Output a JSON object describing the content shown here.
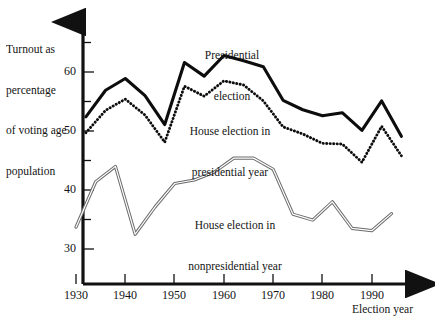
{
  "chart_data": {
    "type": "line",
    "title": "",
    "xlabel": "Election year",
    "ylabel": "Turnout as percentage of voting age population",
    "ylabel_lines": [
      "Turnout as",
      "percentage",
      "of voting age",
      "population"
    ],
    "xlim": [
      1930,
      1996
    ],
    "ylim": [
      28.5,
      65
    ],
    "grid": false,
    "legend_position": "inline-annotations",
    "yticks_major": [
      30,
      40,
      50,
      60
    ],
    "yticks_minor": [
      35,
      45,
      55,
      65
    ],
    "ytick_labels": [
      "30",
      "40",
      "50",
      "60"
    ],
    "xticks": [
      1930,
      1940,
      1950,
      1960,
      1970,
      1980,
      1990
    ],
    "xtick_labels": [
      "1930",
      "1940",
      "1950",
      "1960",
      "1970",
      "1980",
      "1990"
    ],
    "series": [
      {
        "name": "Presidential election",
        "style": "thick-solid",
        "color": "#0d0d0d",
        "label_lines": [
          "Presidential",
          "election"
        ],
        "x": [
          1932,
          1936,
          1940,
          1944,
          1948,
          1952,
          1956,
          1960,
          1964,
          1968,
          1972,
          1976,
          1980,
          1984,
          1988,
          1992,
          1996
        ],
        "values": [
          52.4,
          56.9,
          58.9,
          56.0,
          51.1,
          61.6,
          59.3,
          62.8,
          61.9,
          60.9,
          55.2,
          53.6,
          52.6,
          53.1,
          50.1,
          55.1,
          49.1
        ]
      },
      {
        "name": "House election in presidential year",
        "style": "dotted",
        "color": "#0d0d0d",
        "label_lines": [
          "House election in",
          "presidential year"
        ],
        "x": [
          1932,
          1936,
          1940,
          1944,
          1948,
          1952,
          1956,
          1960,
          1964,
          1968,
          1972,
          1976,
          1980,
          1984,
          1988,
          1992,
          1996
        ],
        "values": [
          49.7,
          53.5,
          55.4,
          52.7,
          48.1,
          57.6,
          55.9,
          58.5,
          57.8,
          55.1,
          50.7,
          49.5,
          47.9,
          47.8,
          44.7,
          50.8,
          45.8
        ]
      },
      {
        "name": "House election in nonpresidential year",
        "style": "thin-double",
        "color": "#6b6b6b",
        "label_lines": [
          "House election in",
          "nonpresidential year"
        ],
        "x": [
          1930,
          1934,
          1938,
          1942,
          1946,
          1950,
          1954,
          1958,
          1962,
          1966,
          1970,
          1974,
          1978,
          1982,
          1986,
          1990,
          1994
        ],
        "values": [
          33.7,
          41.4,
          44.0,
          32.5,
          37.1,
          41.1,
          41.7,
          43.0,
          45.4,
          45.4,
          43.5,
          35.9,
          34.9,
          38.0,
          33.5,
          33.1,
          36.0
        ]
      }
    ]
  },
  "axes": {
    "y_caption_lines": [
      "Turnout as",
      "percentage",
      "of voting age",
      "population"
    ],
    "x_caption": "Election year"
  }
}
